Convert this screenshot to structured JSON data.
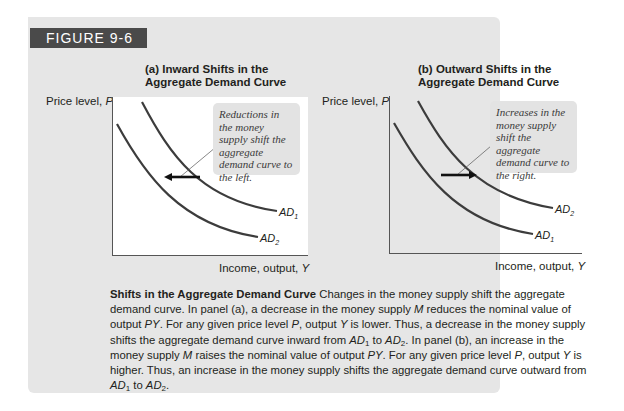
{
  "figure": {
    "label": "FIGURE 9-6",
    "colors": {
      "card_bg": "#e6e6e6",
      "label_bg": "#4a4a4a",
      "label_text": "#ffffff",
      "curve": "#3c3c3c",
      "callout_bg": "#e3e3e3"
    }
  },
  "panel_a": {
    "title_line1": "(a) Inward Shifts in the",
    "title_line2": "Aggregate Demand Curve",
    "y_axis_label": "Price level, ",
    "y_axis_var": "P",
    "x_axis_label": "Income, output, ",
    "x_axis_var": "Y",
    "callout": "Reductions in the money supply shift the aggregate demand curve to the left.",
    "curve_upper_label": "AD",
    "curve_upper_sub": "1",
    "curve_lower_label": "AD",
    "curve_lower_sub": "2",
    "arrow_direction": "left"
  },
  "panel_b": {
    "title_line1": "(b) Outward Shifts in the",
    "title_line2": "Aggregate Demand Curve",
    "y_axis_label": "Price level, ",
    "y_axis_var": "P",
    "x_axis_label": "Income, output, ",
    "x_axis_var": "Y",
    "callout": "Increases in the money supply shift the aggregate demand curve to the right.",
    "curve_upper_label": "AD",
    "curve_upper_sub": "2",
    "curve_lower_label": "AD",
    "curve_lower_sub": "1",
    "arrow_direction": "right"
  },
  "caption": {
    "title": "Shifts in the Aggregate Demand Curve",
    "s1": "  Changes in the money supply shift the aggregate demand curve. In panel (a), a decrease in the money supply ",
    "M1": "M",
    "s2": " reduces the nominal value of output ",
    "PY1": "PY",
    "s3": ". For any given price level ",
    "P1": "P",
    "s4": ", output ",
    "Y1": "Y",
    "s5": " is lower. Thus, a decrease in the money supply shifts the aggregate demand curve inward from ",
    "AD_a": "AD",
    "sub_a": "1",
    "s6": " to ",
    "AD_b": "AD",
    "sub_b": "2",
    "s7": ". In panel (b), an increase in the money supply ",
    "M2": "M",
    "s8": " raises the nominal value of output ",
    "PY2": "PY",
    "s9": ". For any given price level ",
    "P2": "P",
    "s10": ", output ",
    "Y2": "Y",
    "s11": " is higher. Thus, an increase in the money supply shifts the aggregate demand curve outward from ",
    "AD_c": "AD",
    "sub_c": "1",
    "s12": " to ",
    "AD_d": "AD",
    "sub_d": "2",
    "s13": "."
  }
}
